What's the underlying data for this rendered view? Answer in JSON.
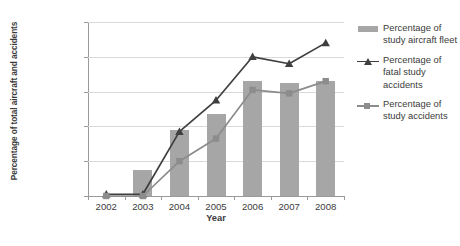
{
  "chart_data": {
    "type": "bar",
    "title": "",
    "subtitle": "",
    "xlabel": "Year",
    "ylabel": "Percentage of total aircraft and accidents",
    "categories": [
      "2002",
      "2003",
      "2004",
      "2005",
      "2006",
      "2007",
      "2008"
    ],
    "ylim": [
      0,
      100
    ],
    "yticks": [
      "0%",
      "20%",
      "40%",
      "60%",
      "80%",
      "100%"
    ],
    "ytick_values": [
      0,
      20,
      40,
      60,
      80,
      100
    ],
    "grid": true,
    "legend_position": "right",
    "series": [
      {
        "name": "Percentage of study aircraft fleet",
        "type": "bar",
        "color": "#a6a6a6",
        "values": [
          0,
          15,
          38,
          47,
          66,
          65,
          66
        ]
      },
      {
        "name": "Percentage of fatal study accidents",
        "type": "line",
        "marker": "triangle",
        "color": "#3f3f3f",
        "values": [
          1,
          1,
          37,
          55,
          80,
          76,
          88
        ]
      },
      {
        "name": "Percentage of study accidents",
        "type": "line",
        "marker": "square",
        "color": "#8c8c8c",
        "values": [
          0,
          0,
          20,
          33,
          61,
          59,
          66
        ]
      }
    ]
  },
  "legend": {
    "entries": [
      {
        "label": "Percentage of study aircraft fleet",
        "key": "bar-swatch"
      },
      {
        "label": "Percentage of fatal study accidents",
        "key": "line-triangle"
      },
      {
        "label": "Percentage of study accidents",
        "key": "line-square"
      }
    ]
  },
  "colors": {
    "bar": "#a6a6a6",
    "fatal_line": "#3f3f3f",
    "accident_line": "#8c8c8c",
    "grid": "#d9d9d9",
    "axis": "#9a9a9a",
    "text": "#3b3b3b",
    "background": "#ffffff"
  }
}
